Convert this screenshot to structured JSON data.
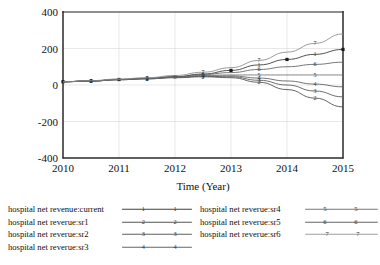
{
  "chart_data": {
    "type": "line",
    "title": "",
    "xlabel": "Time (Year)",
    "ylabel": "",
    "xlim": [
      2010,
      2015
    ],
    "ylim": [
      -400,
      400
    ],
    "xticks": [
      "2010",
      "2011",
      "2012",
      "2013",
      "2014",
      "2015"
    ],
    "yticks": [
      "400",
      "200",
      "0",
      "-200",
      "-400"
    ],
    "grid": true,
    "legend_position": "below-plot",
    "x": [
      2010,
      2010.5,
      2011,
      2011.5,
      2012,
      2012.5,
      2013,
      2013.5,
      2014,
      2014.5,
      2015
    ],
    "series": [
      {
        "name": "hospital net revenue:current",
        "marker": "1",
        "color": "#333333",
        "values": [
          18,
          22,
          30,
          36,
          45,
          60,
          80,
          110,
          140,
          168,
          195
        ]
      },
      {
        "name": "hospital net reverue:sr1",
        "marker": "2",
        "color": "#4a4a4a",
        "values": [
          18,
          22,
          29,
          34,
          40,
          45,
          40,
          15,
          -25,
          -72,
          -120
        ]
      },
      {
        "name": "hospital net reverue:sr2",
        "marker": "3",
        "color": "#555555",
        "values": [
          18,
          22,
          29,
          34,
          41,
          48,
          45,
          26,
          0,
          -33,
          -65
        ]
      },
      {
        "name": "hospital net reverue:sr3",
        "marker": "4",
        "color": "#5a5a5a",
        "values": [
          18,
          22,
          29,
          35,
          42,
          50,
          50,
          38,
          22,
          5,
          -10
        ]
      },
      {
        "name": "hospital net reverue:sr4",
        "marker": "5",
        "color": "#707070",
        "values": [
          18,
          22,
          30,
          35,
          43,
          53,
          55,
          55,
          55,
          55,
          55
        ]
      },
      {
        "name": "hospital net reverue:sr5",
        "marker": "6",
        "color": "#606060",
        "values": [
          18,
          23,
          31,
          37,
          46,
          58,
          68,
          85,
          100,
          113,
          125
        ]
      },
      {
        "name": "hospital net reverue:sr6",
        "marker": "7",
        "color": "#8a8a8a",
        "values": [
          18,
          24,
          33,
          40,
          52,
          70,
          95,
          135,
          180,
          228,
          280
        ]
      }
    ]
  },
  "axes": {
    "xlabel": "Time (Year)",
    "xticks": [
      "2010",
      "2011",
      "2012",
      "2013",
      "2014",
      "2015"
    ],
    "yticks": [
      "400",
      "200",
      "0",
      "-200",
      "-400"
    ]
  },
  "legend": {
    "left_column": [
      {
        "label": "hospital net revenue:current",
        "marker": "1"
      },
      {
        "label": "hospital net reverue:sr1",
        "marker": "2"
      },
      {
        "label": "hospital net reverue:sr2",
        "marker": "3"
      },
      {
        "label": "hospital net reverue:sr3",
        "marker": "4"
      }
    ],
    "right_column": [
      {
        "label": "hospital net reverue:sr4",
        "marker": "5"
      },
      {
        "label": "hospital net reverue:sr5",
        "marker": "6"
      },
      {
        "label": "hospital net reverue:sr6",
        "marker": "7"
      }
    ]
  }
}
